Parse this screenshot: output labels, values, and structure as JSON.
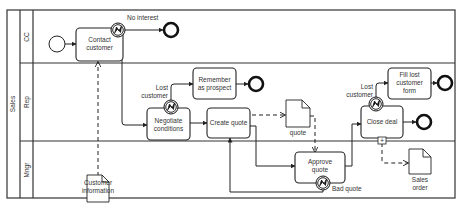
{
  "pool": {
    "label": "Sales"
  },
  "lanes": [
    {
      "label": "CC"
    },
    {
      "label": "Rep"
    },
    {
      "label": "Mngr"
    }
  ],
  "tasks": {
    "contact_customer": [
      "Contact",
      "customer"
    ],
    "negotiate_conditions": [
      "Negotiate",
      "conditions"
    ],
    "remember_as_prospect": [
      "Remember",
      "as prospect"
    ],
    "create_quote": [
      "Create quote"
    ],
    "approve_quote": [
      "Approve",
      "quote"
    ],
    "close_deal": [
      "Close deal"
    ],
    "fill_lost_customer_form": [
      "Fill lost",
      "customer",
      "form"
    ]
  },
  "flow_labels": {
    "no_interest": "No interest",
    "lost_customer_1": [
      "Lost",
      "customer"
    ],
    "lost_customer_2": [
      "Lost",
      "customer"
    ],
    "bad_quote": "Bad quote"
  },
  "data_objects": {
    "customer_information": [
      "Customer",
      "information"
    ],
    "quote": [
      "quote"
    ],
    "sales_order": [
      "Sales",
      "order"
    ]
  },
  "subprocess_marker": "+",
  "colors": {
    "stroke": "#222222",
    "background": "#ffffff"
  }
}
